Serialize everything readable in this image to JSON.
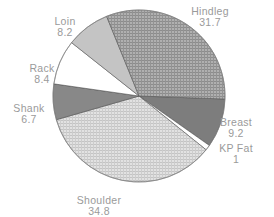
{
  "chart_data": {
    "type": "pie",
    "title": "",
    "start_angle_deg": 2,
    "direction": "clockwise",
    "slices": [
      {
        "label": "Breast",
        "value": 9.2,
        "fill": "#7d7d7d",
        "pattern": "solid"
      },
      {
        "label": "KP Fat",
        "value": 1,
        "fill": "#ffffff",
        "pattern": "solid"
      },
      {
        "label": "Shoulder",
        "value": 34.8,
        "fill": "#d6d6d6",
        "pattern": "fine-grid"
      },
      {
        "label": "Shank",
        "value": 6.7,
        "fill": "#888888",
        "pattern": "solid"
      },
      {
        "label": "Rack",
        "value": 8.4,
        "fill": "#ffffff",
        "pattern": "solid"
      },
      {
        "label": "Loin",
        "value": 8.2,
        "fill": "#c4c4c4",
        "pattern": "solid"
      },
      {
        "label": "Hindleg",
        "value": 31.7,
        "fill": "#a3a3a3",
        "pattern": "grid"
      }
    ],
    "labels": [
      {
        "name": "Hindleg",
        "value": "31.7",
        "x": 210,
        "y": 6
      },
      {
        "name": "Loin",
        "value": "8.2",
        "x": 65,
        "y": 16
      },
      {
        "name": "Rack",
        "value": "8.4",
        "x": 42,
        "y": 63
      },
      {
        "name": "Shank",
        "value": "6.7",
        "x": 29,
        "y": 103
      },
      {
        "name": "Breast",
        "value": "9.2",
        "x": 236,
        "y": 117
      },
      {
        "name": "KP Fat",
        "value": "1",
        "x": 236,
        "y": 143
      },
      {
        "name": "Shoulder",
        "value": "34.8",
        "x": 99,
        "y": 195
      }
    ],
    "center": [
      139,
      96
    ],
    "radius": 86,
    "legend": "none"
  }
}
